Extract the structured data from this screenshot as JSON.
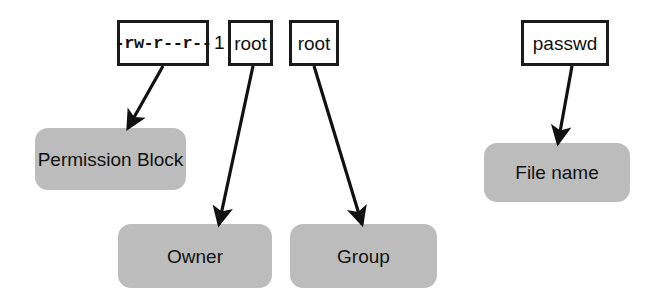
{
  "diagram": {
    "colors": {
      "box_border": "#1a1a1a",
      "box_fill": "#ffffff",
      "label_fill": "#bcbcbc",
      "text": "#111111",
      "arrow": "#111111",
      "background": "#ffffff"
    },
    "code_boxes": [
      {
        "id": "permissions",
        "text": "-rw-r--r--"
      },
      {
        "id": "owner-name",
        "text": "root"
      },
      {
        "id": "group-name",
        "text": "root"
      },
      {
        "id": "file-name",
        "text": "passwd"
      }
    ],
    "bare_text": [
      {
        "id": "link-count",
        "text": "1"
      }
    ],
    "label_boxes": [
      {
        "id": "permission-block",
        "text": "Permission Block"
      },
      {
        "id": "owner",
        "text": "Owner"
      },
      {
        "id": "group",
        "text": "Group"
      },
      {
        "id": "file-name-label",
        "text": "File name"
      }
    ]
  }
}
